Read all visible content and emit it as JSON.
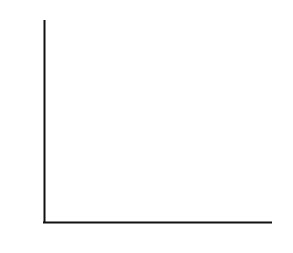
{
  "chart_data": {
    "type": "line",
    "title": "",
    "subtitle": "",
    "xlabel": "",
    "ylabel": "Violent crime rate (%)",
    "xlim": [
      1982,
      1999
    ],
    "ylim": [
      0,
      60
    ],
    "yticks": [
      0,
      20,
      40,
      60
    ],
    "ytick_labels": [
      "0",
      "20",
      "40",
      "60"
    ],
    "xticks": [
      1982,
      1986,
      1990,
      1994,
      1998,
      1999
    ],
    "xtick_labels": [
      "1982",
      "1986",
      "1990",
      "1994",
      "1998",
      "1999"
    ],
    "xtick_minor": [
      1983,
      1984,
      1985,
      1987,
      1988,
      1989,
      1991,
      1992,
      1993,
      1995,
      1996,
      1997
    ],
    "grid": true,
    "grid_color": "#d2d2d2",
    "axis_color": "#111111",
    "legend": null,
    "legend_position": "none",
    "marker_years": [
      1982,
      1986,
      1990,
      1994,
      1998,
      1999
    ],
    "x": [
      1982,
      1983,
      1984,
      1985,
      1986,
      1987,
      1988,
      1989,
      1990,
      1991,
      1992,
      1993,
      1994,
      1995,
      1996,
      1997,
      1998,
      1999
    ],
    "series": [
      {
        "name": "Lower band",
        "color": "#b4b4b4",
        "values": [
          48.5,
          45.0,
          44.0,
          42.0,
          40.8,
          42.5,
          42.0,
          42.0,
          42.2,
          47.0,
          46.0,
          47.5,
          49.2,
          44.5,
          40.5,
          36.5,
          33.0,
          29.5
        ]
      },
      {
        "name": "Upper band",
        "color": "#4a4a4a",
        "values": [
          50.0,
          46.5,
          45.5,
          43.5,
          42.0,
          44.0,
          43.5,
          43.5,
          44.0,
          48.5,
          47.5,
          49.0,
          50.5,
          46.0,
          42.0,
          38.0,
          34.5,
          31.0
        ]
      }
    ]
  },
  "axis": {
    "y_title": "Violent crime rate (%)"
  }
}
